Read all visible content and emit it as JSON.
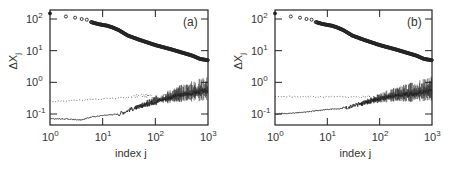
{
  "chart_data": [
    {
      "type": "scatter",
      "panel_label": "(a)",
      "xlabel": "index j",
      "ylabel": "ΔX_j",
      "xscale": "log",
      "yscale": "log",
      "xlim": [
        1,
        1000
      ],
      "ylim": [
        0.05,
        200
      ],
      "xticks": [
        "10^0",
        "10^1",
        "10^2",
        "10^3"
      ],
      "yticks": [
        "10^-1",
        "10^0",
        "10^1",
        "10^2"
      ],
      "grid": false,
      "legend": "none",
      "series": [
        {
          "name": "spectrum (circles)",
          "style": "open-circle markers",
          "x": [
            1,
            2,
            3,
            4,
            5,
            6,
            8,
            10,
            12,
            15,
            20,
            30,
            50,
            100,
            200,
            300,
            500,
            700,
            1000
          ],
          "y": [
            150,
            120,
            110,
            100,
            95,
            80,
            70,
            65,
            62,
            55,
            45,
            30,
            22,
            15,
            11,
            9,
            7,
            5.5,
            5
          ]
        },
        {
          "name": "dotted curve",
          "style": "dotted line",
          "x": [
            1,
            3,
            10,
            30,
            50,
            100,
            300,
            1000
          ],
          "y": [
            0.25,
            0.27,
            0.3,
            0.33,
            0.38,
            0.36,
            0.38,
            0.42
          ]
        },
        {
          "name": "solid curve",
          "style": "solid line (noisy at large j)",
          "x": [
            1,
            2,
            4,
            6,
            10,
            20,
            30,
            50,
            100,
            300,
            1000
          ],
          "y": [
            0.07,
            0.07,
            0.065,
            0.08,
            0.09,
            0.1,
            0.13,
            0.17,
            0.25,
            0.4,
            0.55
          ]
        }
      ]
    },
    {
      "type": "scatter",
      "panel_label": "(b)",
      "xlabel": "index j",
      "ylabel": "ΔX_j",
      "xscale": "log",
      "yscale": "log",
      "xlim": [
        1,
        1000
      ],
      "ylim": [
        0.05,
        200
      ],
      "xticks": [
        "10^0",
        "10^1",
        "10^2",
        "10^3"
      ],
      "yticks": [
        "10^-1",
        "10^0",
        "10^1",
        "10^2"
      ],
      "grid": false,
      "legend": "none",
      "series": [
        {
          "name": "spectrum (circles)",
          "style": "open-circle markers",
          "x": [
            1,
            2,
            3,
            4,
            5,
            6,
            8,
            10,
            12,
            15,
            20,
            30,
            50,
            100,
            200,
            300,
            500,
            700,
            1000
          ],
          "y": [
            150,
            120,
            110,
            100,
            95,
            80,
            70,
            65,
            62,
            55,
            45,
            30,
            22,
            15,
            11,
            9,
            7,
            5.5,
            5
          ]
        },
        {
          "name": "dotted curve",
          "style": "dotted line (flat)",
          "x": [
            1,
            10,
            100,
            1000
          ],
          "y": [
            0.35,
            0.35,
            0.35,
            0.35
          ]
        },
        {
          "name": "solid curve",
          "style": "solid line (noisy at large j)",
          "x": [
            1,
            3,
            10,
            20,
            50,
            100,
            200,
            500,
            1000
          ],
          "y": [
            0.1,
            0.11,
            0.14,
            0.15,
            0.22,
            0.3,
            0.38,
            0.45,
            0.55
          ]
        }
      ]
    }
  ],
  "panels": [
    {
      "label": "(a)",
      "xlabel": "index j",
      "ylabel_main": "ΔX",
      "ylabel_sub": "j",
      "xticks": [
        {
          "base": "10",
          "exp": "0"
        },
        {
          "base": "10",
          "exp": "1"
        },
        {
          "base": "10",
          "exp": "2"
        },
        {
          "base": "10",
          "exp": "3"
        }
      ],
      "yticks": [
        {
          "base": "10",
          "exp": "-1"
        },
        {
          "base": "10",
          "exp": "0"
        },
        {
          "base": "10",
          "exp": "1"
        },
        {
          "base": "10",
          "exp": "2"
        }
      ]
    },
    {
      "label": "(b)",
      "xlabel": "index j",
      "ylabel_main": "ΔX",
      "ylabel_sub": "j",
      "xticks": [
        {
          "base": "10",
          "exp": "0"
        },
        {
          "base": "10",
          "exp": "1"
        },
        {
          "base": "10",
          "exp": "2"
        },
        {
          "base": "10",
          "exp": "3"
        }
      ],
      "yticks": [
        {
          "base": "10",
          "exp": "-1"
        },
        {
          "base": "10",
          "exp": "0"
        },
        {
          "base": "10",
          "exp": "1"
        },
        {
          "base": "10",
          "exp": "2"
        }
      ]
    }
  ],
  "colors": {
    "ink": "#222222",
    "axis_text": "#333333",
    "background": "#ffffff"
  }
}
